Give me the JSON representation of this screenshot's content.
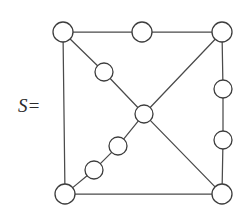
{
  "figure": {
    "label_text": "S=",
    "label_x": 18,
    "label_y": 96,
    "background_color": "#ffffff",
    "edge_color": "#4a4a4a",
    "node_stroke_color": "#3d3d3d",
    "node_fill_color": "#ffffff",
    "edge_stroke_width": 1.25,
    "node_stroke_width": 1.3,
    "width": 245,
    "height": 209
  },
  "chart_data": {
    "type": "diagram",
    "diagram_kind": "undirected-graph",
    "title": "S=",
    "node_radius_corner": 10,
    "node_radius_inner": 9,
    "nodes": [
      {
        "id": "tl",
        "name": "top-left-corner",
        "x": 63,
        "y": 32,
        "r": 10,
        "degree": 3
      },
      {
        "id": "tm",
        "name": "top-middle",
        "x": 142,
        "y": 32,
        "r": 10,
        "degree": 2
      },
      {
        "id": "tr",
        "name": "top-right-corner",
        "x": 222,
        "y": 32,
        "r": 10,
        "degree": 3
      },
      {
        "id": "r1",
        "name": "right-upper",
        "x": 223,
        "y": 89,
        "r": 9,
        "degree": 2
      },
      {
        "id": "r2",
        "name": "right-lower",
        "x": 223,
        "y": 140,
        "r": 9,
        "degree": 2
      },
      {
        "id": "br",
        "name": "bottom-right-corner",
        "x": 222,
        "y": 194,
        "r": 10,
        "degree": 3
      },
      {
        "id": "bl",
        "name": "bottom-left-corner",
        "x": 65,
        "y": 194,
        "r": 10,
        "degree": 3
      },
      {
        "id": "d1",
        "name": "upper-left-diagonal",
        "x": 104,
        "y": 72,
        "r": 9,
        "degree": 2
      },
      {
        "id": "c",
        "name": "center",
        "x": 144,
        "y": 114,
        "r": 9,
        "degree": 4
      },
      {
        "id": "d2",
        "name": "lower-left-diagonal-upper",
        "x": 118,
        "y": 146,
        "r": 9,
        "degree": 2
      },
      {
        "id": "d3",
        "name": "lower-left-diagonal-lower",
        "x": 94,
        "y": 170,
        "r": 9,
        "degree": 2
      }
    ],
    "edges": [
      {
        "from": "tl",
        "to": "tm",
        "name": "top-left-segment"
      },
      {
        "from": "tm",
        "to": "tr",
        "name": "top-right-segment"
      },
      {
        "from": "tl",
        "to": "bl",
        "name": "left-side"
      },
      {
        "from": "tr",
        "to": "r1",
        "name": "right-side-upper-segment"
      },
      {
        "from": "r1",
        "to": "r2",
        "name": "right-side-middle-segment"
      },
      {
        "from": "r2",
        "to": "br",
        "name": "right-side-lower-segment"
      },
      {
        "from": "bl",
        "to": "br",
        "name": "bottom-side"
      },
      {
        "from": "tl",
        "to": "d1",
        "name": "main-diagonal-upper-a"
      },
      {
        "from": "d1",
        "to": "c",
        "name": "main-diagonal-upper-b"
      },
      {
        "from": "c",
        "to": "d2",
        "name": "main-diagonal-lower-a"
      },
      {
        "from": "d2",
        "to": "d3",
        "name": "main-diagonal-lower-b"
      },
      {
        "from": "d3",
        "to": "bl",
        "name": "main-diagonal-lower-c"
      },
      {
        "from": "tr",
        "to": "c",
        "name": "anti-diagonal-upper"
      },
      {
        "from": "c",
        "to": "br",
        "name": "anti-diagonal-lower"
      }
    ],
    "node_count": 11,
    "edge_count": 14
  }
}
